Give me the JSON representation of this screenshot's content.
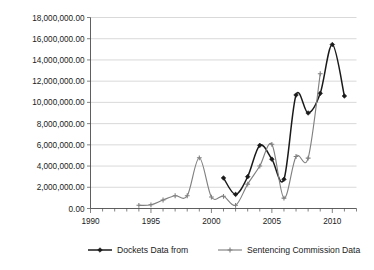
{
  "chart_data": {
    "type": "line",
    "title": "",
    "xlabel": "",
    "ylabel": "",
    "xlim": [
      1990,
      2012
    ],
    "ylim": [
      0,
      18000000
    ],
    "grid": true,
    "legend_position": "bottom",
    "x_tick_labels": [
      "1990",
      "1995",
      "2000",
      "2005",
      "2010"
    ],
    "x_tick_values": [
      1990,
      1995,
      2000,
      2005,
      2010
    ],
    "x_minor_tick_step": 1,
    "y_tick_labels": [
      "0.00",
      "2,000,000.00",
      "4,000,000.00",
      "6,000,000.00",
      "8,000,000.00",
      "10,000,000.00",
      "12,000,000.00",
      "14,000,000.00",
      "16,000,000.00",
      "18,000,000.00"
    ],
    "y_tick_values": [
      0,
      2000000,
      4000000,
      6000000,
      8000000,
      10000000,
      12000000,
      14000000,
      16000000,
      18000000
    ],
    "series": [
      {
        "name": "Dockets Data from",
        "color": "#1a1a1a",
        "marker": "diamond",
        "x": [
          2001,
          2002,
          2003,
          2004,
          2005,
          2006,
          2007,
          2008,
          2009,
          2010,
          2011
        ],
        "values": [
          2880000,
          1330000,
          3000000,
          5950000,
          4650000,
          2750000,
          10700000,
          9000000,
          10850000,
          15450000,
          10600000
        ]
      },
      {
        "name": "Sentencing Commission Data",
        "color": "#808080",
        "marker": "plus",
        "x": [
          1994,
          1995,
          1996,
          1997,
          1998,
          1999,
          2000,
          2001,
          2002,
          2003,
          2004,
          2005,
          2006,
          2007,
          2008,
          2009
        ],
        "values": [
          300000,
          350000,
          800000,
          1200000,
          1200000,
          4780000,
          1080000,
          1150000,
          300000,
          2300000,
          4000000,
          6050000,
          980000,
          4900000,
          4750000,
          12700000
        ]
      }
    ]
  },
  "legend": {
    "entries": [
      {
        "label": "Dockets Data from",
        "color": "#1a1a1a"
      },
      {
        "label": "Sentencing Commission Data",
        "color": "#808080"
      }
    ]
  }
}
